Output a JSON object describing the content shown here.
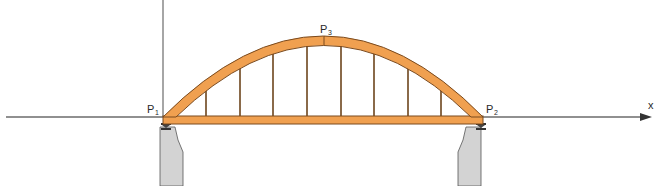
{
  "diagram": {
    "axes": {
      "x_label": "x",
      "axis_color": "#6b6b6b"
    },
    "points": [
      {
        "name": "P",
        "sub": "1"
      },
      {
        "name": "P",
        "sub": "2"
      },
      {
        "name": "P",
        "sub": "3"
      }
    ],
    "colors": {
      "arch_fill": "#f0a050",
      "arch_stroke": "#7a4a1e",
      "hanger": "#8a6a4a",
      "pier_fill": "#d3d3d3",
      "pier_stroke": "#555555"
    },
    "hanger_count": 8
  }
}
